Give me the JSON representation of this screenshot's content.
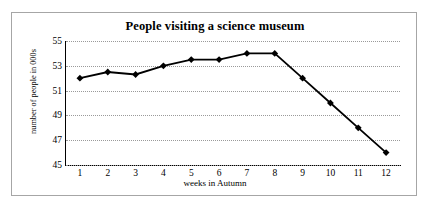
{
  "chart_data": {
    "type": "line",
    "title": "People visiting a science museum",
    "xlabel": "weeks in Autumn",
    "ylabel": "number of people in 000s",
    "categories": [
      1,
      2,
      3,
      4,
      5,
      6,
      7,
      8,
      9,
      10,
      11,
      12
    ],
    "x_tick_labels": [
      "1",
      "2",
      "3",
      "4",
      "5",
      "6",
      "7",
      "8",
      "9",
      "10",
      "11",
      "12"
    ],
    "values": [
      52,
      52.5,
      52.3,
      53,
      53.5,
      53.5,
      54,
      54,
      52,
      50,
      48,
      46
    ],
    "series": [
      {
        "name": "number of people in 000s",
        "values": [
          52,
          52.5,
          52.3,
          53,
          53.5,
          53.5,
          54,
          54,
          52,
          50,
          48,
          46
        ],
        "color": "#000000",
        "marker": "diamond"
      }
    ],
    "ylim": [
      45,
      55
    ],
    "y_ticks": [
      45,
      47,
      49,
      51,
      53,
      55
    ],
    "y_tick_labels": [
      "45",
      "47",
      "49",
      "51",
      "53",
      "55"
    ],
    "xlim": [
      0.5,
      12.5
    ],
    "grid": "horizontal-dotted",
    "legend": "none",
    "line_color": "#000000",
    "gridline_color": "#9a9a9a",
    "axis_color": "#000000",
    "border_color": "#a6a6a6",
    "background": "#ffffff"
  }
}
